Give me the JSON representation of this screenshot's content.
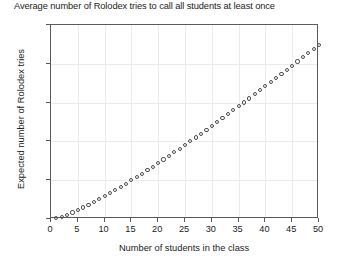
{
  "chart_data": {
    "type": "scatter",
    "title": "Average number of Rolodex tries to call all students at least once",
    "xlabel": "Number of students in the class",
    "ylabel": "Expected number of Rolodex tries",
    "xlim": [
      0,
      50
    ],
    "ylim": [
      0,
      250
    ],
    "xticks": [
      0,
      5,
      10,
      15,
      20,
      25,
      30,
      35,
      40,
      45,
      50
    ],
    "yticks": [
      0,
      50,
      100,
      150,
      200,
      250
    ],
    "grid": true,
    "legend": "none",
    "marker": "open-circle",
    "marker_color": "#4d4d55",
    "x": [
      1,
      2,
      3,
      4,
      5,
      6,
      7,
      8,
      9,
      10,
      11,
      12,
      13,
      14,
      15,
      16,
      17,
      18,
      19,
      20,
      21,
      22,
      23,
      24,
      25,
      26,
      27,
      28,
      29,
      30,
      31,
      32,
      33,
      34,
      35,
      36,
      37,
      38,
      39,
      40,
      41,
      42,
      43,
      44,
      45,
      46,
      47,
      48,
      49,
      50
    ],
    "values": [
      1.0,
      3.0,
      5.5,
      8.3,
      11.4,
      14.7,
      18.2,
      21.7,
      25.5,
      29.3,
      33.2,
      37.2,
      41.3,
      45.5,
      49.8,
      54.1,
      58.5,
      62.9,
      67.4,
      72.0,
      76.6,
      81.2,
      85.9,
      90.6,
      95.4,
      100.2,
      105.1,
      110.0,
      114.9,
      119.8,
      124.8,
      129.8,
      134.9,
      140.0,
      145.1,
      150.2,
      155.4,
      160.6,
      165.8,
      171.0,
      176.3,
      181.6,
      186.9,
      192.2,
      197.6,
      202.9,
      208.3,
      213.7,
      219.2,
      224.6
    ]
  }
}
